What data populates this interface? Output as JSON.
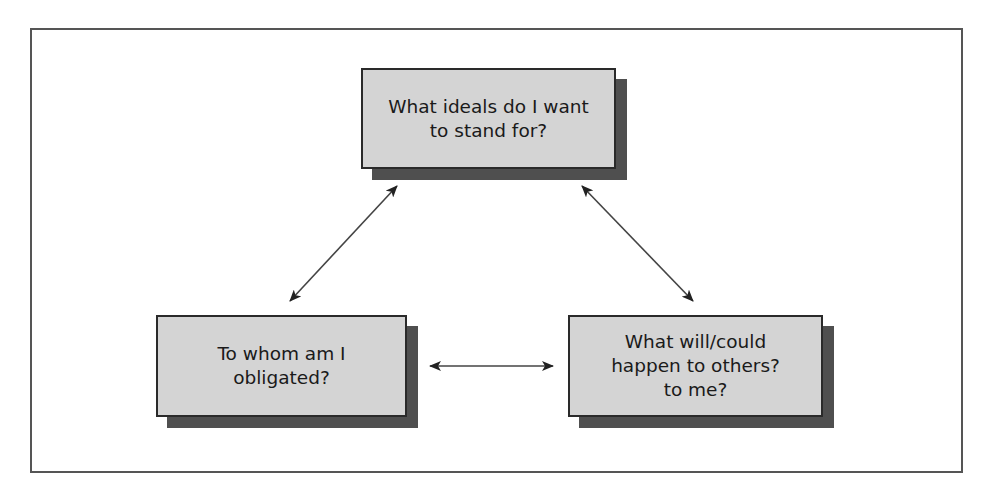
{
  "diagram": {
    "type": "triangle-relationship",
    "nodes": [
      {
        "id": "top",
        "label": "What ideals do I want\nto stand for?"
      },
      {
        "id": "left",
        "label": "To whom am I\nobligated?"
      },
      {
        "id": "right",
        "label": "What will/could\nhappen to others?\nto me?"
      }
    ],
    "edges": [
      {
        "from": "top",
        "to": "left",
        "direction": "bidirectional"
      },
      {
        "from": "top",
        "to": "right",
        "direction": "bidirectional"
      },
      {
        "from": "left",
        "to": "right",
        "direction": "bidirectional"
      }
    ],
    "colors": {
      "box_fill": "#d4d4d4",
      "box_border": "#2a2a2a",
      "shadow": "#4f4f4f",
      "frame": "#555555",
      "arrow": "#333333"
    }
  }
}
